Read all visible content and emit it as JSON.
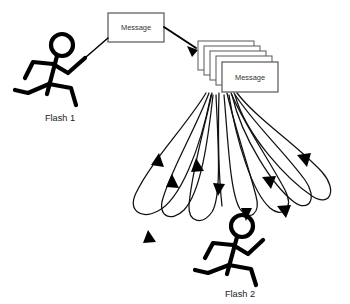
{
  "diagram": {
    "background_color": "#ffffff",
    "line_color": "#000000",
    "box_stroke_color": "#666666",
    "box_fill_color": "#ffffff",
    "text_color": "#333333"
  },
  "sender": {
    "label": "Flash 1",
    "icon": "running-stick-figure-icon"
  },
  "receiver": {
    "label": "Flash 2",
    "icon": "running-stick-figure-icon"
  },
  "source_message": {
    "label": "Message"
  },
  "message_stack": {
    "front_label": "Message",
    "card_count": 5,
    "labels": [
      "Message",
      "",
      "",
      "",
      ""
    ]
  },
  "connections": {
    "sender_to_message": {
      "style": "solid-line",
      "arrow": false
    },
    "message_to_stack": {
      "style": "solid-arrow",
      "arrow": true
    },
    "stack_to_receiver": {
      "style": "looping-arrows",
      "arrow": true,
      "loop_count": 8
    }
  }
}
